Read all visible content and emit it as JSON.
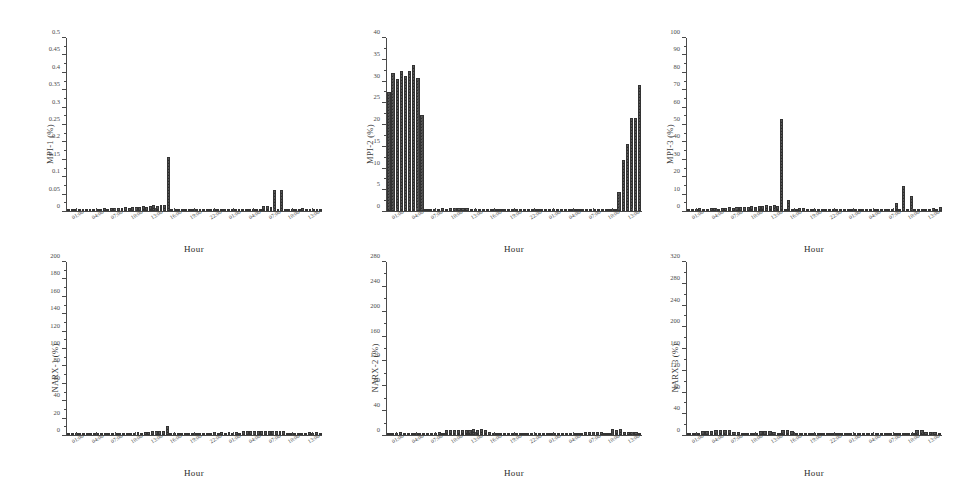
{
  "figure": {
    "layout": "2 rows x 3 columns of bar charts",
    "background": "#ffffff",
    "bar_color": "#5a5a5a",
    "axis_color": "#4a4a4a"
  },
  "chart_data": [
    {
      "type": "bar",
      "id": "mpi-1",
      "title": "",
      "ylabel": "MPI-1 (%)",
      "xlabel": "Hour",
      "ylim": [
        0,
        0.5
      ],
      "yticks": [
        0,
        0.05,
        0.1,
        0.15,
        0.2,
        0.25,
        0.3,
        0.35,
        0.4,
        0.45,
        0.5
      ],
      "ytick_labels": [
        "0",
        "0.05",
        "0.1",
        "0.15",
        "0.2",
        "0.25",
        "0.3",
        "0.35",
        "0.4",
        "0.45",
        "0.5"
      ],
      "grid": false,
      "xtick_labels": [
        "01:00",
        "04:00",
        "07:00",
        "10:00",
        "13:00",
        "16:00",
        "19:00",
        "22:00",
        "01:00",
        "04:00",
        "07:00",
        "10:00",
        "13:00"
      ],
      "values": [
        0.004,
        0.005,
        0.004,
        0.003,
        0.006,
        0.007,
        0.006,
        0.005,
        0.004,
        0.006,
        0.008,
        0.007,
        0.009,
        0.008,
        0.01,
        0.009,
        0.011,
        0.01,
        0.012,
        0.013,
        0.012,
        0.014,
        0.013,
        0.015,
        0.016,
        0.015,
        0.018,
        0.016,
        0.155,
        0.004,
        0.003,
        0.002,
        0.002,
        0.002,
        0.003,
        0.002,
        0.002,
        0.003,
        0.002,
        0.002,
        0.003,
        0.002,
        0.002,
        0.002,
        0.003,
        0.002,
        0.002,
        0.003,
        0.002,
        0.002,
        0.003,
        0.002,
        0.002,
        0.003,
        0.002,
        0.014,
        0.015,
        0.013,
        0.062,
        0.004,
        0.062,
        0.004,
        0.003,
        0.002,
        0.002,
        0.002,
        0.008,
        0.007,
        0.006,
        0.007,
        0.006,
        0.005
      ]
    },
    {
      "type": "bar",
      "id": "mpi-2",
      "title": "",
      "ylabel": "MPI-2 (%)",
      "xlabel": "Hour",
      "ylim": [
        0,
        40
      ],
      "yticks": [
        0,
        5,
        10,
        15,
        20,
        25,
        30,
        35,
        40
      ],
      "ytick_labels": [
        "0",
        "5",
        "10",
        "15",
        "20",
        "25",
        "30",
        "35",
        "40"
      ],
      "grid": false,
      "xtick_labels": [
        "01:00",
        "04:00",
        "07:00",
        "10:00",
        "13:00",
        "16:00",
        "19:00",
        "22:00",
        "01:00",
        "04:00",
        "07:00",
        "10:00",
        "13:00"
      ],
      "values": [
        27.5,
        31.8,
        30.6,
        32.4,
        31.2,
        32.3,
        33.8,
        30.7,
        22.2,
        0.4,
        0.3,
        0.2,
        0.2,
        0.6,
        0.5,
        0.8,
        0.7,
        0.8,
        0.6,
        0.7,
        0.5,
        0.4,
        0.3,
        0.3,
        0.2,
        0.2,
        0.3,
        0.2,
        0.2,
        0.2,
        0.3,
        0.2,
        0.2,
        0.2,
        0.2,
        0.3,
        0.2,
        0.2,
        0.3,
        0.2,
        0.2,
        0.2,
        0.3,
        0.2,
        0.2,
        0.3,
        0.2,
        0.2,
        0.3,
        0.2,
        0.2,
        0.3,
        0.2,
        0.2,
        0.3,
        0.3,
        4.3,
        11.7,
        15.6,
        21.5,
        21.5,
        29.2
      ]
    },
    {
      "type": "bar",
      "id": "mpi-3",
      "title": "",
      "ylabel": "MPI-3 (%)",
      "xlabel": "Hour",
      "ylim": [
        0,
        100
      ],
      "yticks": [
        0,
        10,
        20,
        30,
        40,
        50,
        60,
        70,
        80,
        90,
        100
      ],
      "ytick_labels": [
        "0",
        "10",
        "20",
        "30",
        "40",
        "50",
        "60",
        "70",
        "80",
        "90",
        "100"
      ],
      "grid": false,
      "xtick_labels": [
        "01:00",
        "04:00",
        "07:00",
        "10:00",
        "13:00",
        "16:00",
        "19:00",
        "22:00",
        "01:00",
        "04:00",
        "07:00",
        "10:00",
        "13:00"
      ],
      "values": [
        1.2,
        1.4,
        1.0,
        1.6,
        1.3,
        1.2,
        1.8,
        1.5,
        1.4,
        2.0,
        1.8,
        2.2,
        1.9,
        2.4,
        2.1,
        2.6,
        2.3,
        2.8,
        2.5,
        3.0,
        2.7,
        3.2,
        2.9,
        3.5,
        3.1,
        53.0,
        0.8,
        6.5,
        0.6,
        0.5,
        1.8,
        1.6,
        1.2,
        1.0,
        0.9,
        1.1,
        0.8,
        0.9,
        1.0,
        0.8,
        0.7,
        0.9,
        0.8,
        0.7,
        0.8,
        0.7,
        0.9,
        0.8,
        0.7,
        0.8,
        0.9,
        0.8,
        0.7,
        1.0,
        0.9,
        1.2,
        4.6,
        1.0,
        14.4,
        1.0,
        8.6,
        0.6,
        0.5,
        0.6,
        1.4,
        1.2,
        1.6,
        1.3,
        2.6
      ]
    },
    {
      "type": "bar",
      "id": "narx-1",
      "title": "",
      "ylabel": "NARX-1 (%)",
      "xlabel": "Hour",
      "ylim": [
        0,
        200
      ],
      "yticks": [
        0,
        20,
        40,
        60,
        80,
        100,
        120,
        140,
        160,
        180,
        200
      ],
      "ytick_labels": [
        "0",
        "20",
        "40",
        "60",
        "80",
        "100",
        "120",
        "140",
        "160",
        "180",
        "200"
      ],
      "grid": false,
      "xtick_labels": [
        "01:00",
        "04:00",
        "07:00",
        "10:00",
        "13:00",
        "16:00",
        "19:00",
        "22:00",
        "01:00",
        "04:00",
        "07:00",
        "10:00",
        "13:00"
      ],
      "values": [
        1.6,
        1.4,
        1.8,
        0.9,
        0.8,
        0.9,
        0.8,
        0.9,
        0.8,
        0.9,
        1.0,
        0.9,
        0.8,
        0.9,
        1.0,
        0.9,
        0.8,
        1.0,
        0.9,
        3.2,
        2.8,
        3.4,
        3.0,
        4.6,
        4.4,
        4.8,
        4.4,
        10.6,
        1.8,
        1.5,
        1.6,
        1.4,
        1.2,
        1.0,
        1.2,
        1.0,
        1.1,
        0.9,
        1.0,
        0.9,
        3.0,
        2.6,
        3.2,
        2.8,
        3.4,
        2.9,
        3.0,
        2.6,
        4.6,
        4.4,
        5.0,
        4.8,
        4.4,
        4.2,
        4.8,
        4.4,
        4.6,
        4.2,
        5.0,
        4.6,
        2.4,
        2.0,
        1.8,
        1.2,
        1.0,
        1.2,
        3.0,
        2.8,
        3.2,
        2.6
      ]
    },
    {
      "type": "bar",
      "id": "narx-2",
      "title": "",
      "ylabel": "NARX-2 (%)",
      "xlabel": "Hour",
      "ylim": [
        0,
        280
      ],
      "yticks": [
        0,
        40,
        80,
        120,
        160,
        200,
        240,
        280
      ],
      "ytick_labels": [
        "0",
        "40",
        "80",
        "120",
        "160",
        "200",
        "240",
        "280"
      ],
      "grid": false,
      "xtick_labels": [
        "01:00",
        "04:00",
        "07:00",
        "10:00",
        "13:00",
        "16:00",
        "19:00",
        "22:00",
        "01:00",
        "04:00",
        "07:00",
        "10:00",
        "13:00"
      ],
      "values": [
        3.6,
        4.0,
        3.4,
        4.2,
        3.8,
        3.2,
        3.0,
        3.4,
        2.8,
        3.0,
        2.6,
        2.8,
        3.0,
        4.4,
        4.0,
        7.6,
        8.0,
        7.4,
        8.2,
        7.8,
        8.4,
        7.6,
        9.0,
        8.6,
        9.2,
        8.8,
        4.2,
        4.0,
        1.0,
        0.8,
        0.9,
        0.8,
        0.7,
        0.9,
        0.8,
        0.7,
        0.9,
        0.8,
        0.7,
        0.8,
        0.9,
        0.8,
        0.7,
        0.9,
        1.0,
        0.9,
        1.6,
        1.8,
        2.0,
        1.4,
        3.6,
        4.2,
        5.0,
        4.8,
        5.2,
        4.6,
        4.0,
        3.6,
        9.2,
        8.6,
        9.0,
        5.4,
        5.0,
        5.2,
        4.2,
        3.8
      ]
    },
    {
      "type": "bar",
      "id": "narx-3",
      "title": "",
      "ylabel": "NARX-3 (%)",
      "xlabel": "Hour",
      "ylim": [
        0,
        320
      ],
      "yticks": [
        0,
        40,
        80,
        120,
        160,
        200,
        240,
        280,
        320
      ],
      "ytick_labels": [
        "0",
        "40",
        "80",
        "120",
        "160",
        "200",
        "240",
        "280",
        "320"
      ],
      "grid": false,
      "xtick_labels": [
        "01:00",
        "04:00",
        "07:00",
        "10:00",
        "13:00",
        "16:00",
        "19:00",
        "22:00",
        "01:00",
        "04:00",
        "07:00",
        "10:00",
        "13:00"
      ],
      "values": [
        4.0,
        3.6,
        4.2,
        6.8,
        7.2,
        6.6,
        9.0,
        8.6,
        9.2,
        8.8,
        5.2,
        4.8,
        4.4,
        4.0,
        4.6,
        4.2,
        6.8,
        7.2,
        6.6,
        5.0,
        4.6,
        8.4,
        8.8,
        8.2,
        3.0,
        2.6,
        1.2,
        1.0,
        0.9,
        1.1,
        1.0,
        0.9,
        1.2,
        1.0,
        0.9,
        1.0,
        1.2,
        1.0,
        0.9,
        1.0,
        1.2,
        2.0,
        1.8,
        3.2,
        3.6,
        4.0,
        3.4,
        4.2,
        3.8,
        4.4,
        4.0,
        8.6,
        9.0,
        5.2,
        4.8,
        5.0,
        4.4
      ]
    }
  ]
}
